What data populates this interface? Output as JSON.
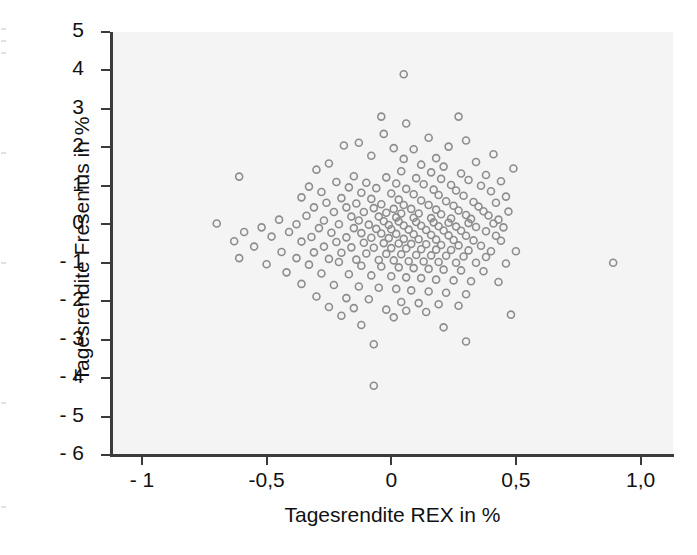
{
  "chart_data": {
    "type": "scatter",
    "title": "",
    "xlabel": "Tagesrendite REX in %",
    "ylabel": "Tagesrendite Fresenius in %",
    "xlim": [
      -1.12,
      1.13
    ],
    "ylim": [
      -6,
      5
    ],
    "grid": false,
    "legend": null,
    "xticks": [
      -1,
      -0.5,
      0,
      0.5,
      1
    ],
    "xticklabels": [
      "- 1",
      "-0,5",
      "0",
      "0,5",
      "1,0"
    ],
    "yticks": [
      5,
      4,
      3,
      2,
      1,
      0,
      -1,
      -2,
      -3,
      -4,
      -5,
      -6
    ],
    "yticklabels": [
      "5",
      "4",
      "3",
      "2",
      "1",
      "0",
      "- 1",
      "- 2",
      "- 3",
      "- 4",
      "- 5",
      "- 6"
    ],
    "marker": {
      "shape": "circle-open",
      "diameter_px": 7,
      "stroke_color": "#8d8d8d",
      "stroke_width": 1.6,
      "fill": "none"
    },
    "panel_facecolor": "#f4f4f4",
    "axis_color": "#3b3b3b",
    "n_points": 232,
    "points": [
      [
        0.05,
        3.9
      ],
      [
        -0.04,
        2.8
      ],
      [
        0.27,
        2.8
      ],
      [
        0.06,
        2.62
      ],
      [
        -0.03,
        2.35
      ],
      [
        0.15,
        2.25
      ],
      [
        0.3,
        2.18
      ],
      [
        -0.13,
        2.12
      ],
      [
        -0.19,
        2.05
      ],
      [
        0.23,
        2.02
      ],
      [
        0.01,
        1.98
      ],
      [
        0.09,
        1.95
      ],
      [
        0.41,
        1.82
      ],
      [
        -0.08,
        1.78
      ],
      [
        0.18,
        1.72
      ],
      [
        0.05,
        1.7
      ],
      [
        0.34,
        1.62
      ],
      [
        -0.25,
        1.58
      ],
      [
        0.12,
        1.55
      ],
      [
        0.21,
        1.5
      ],
      [
        0.49,
        1.45
      ],
      [
        -0.3,
        1.42
      ],
      [
        -0.61,
        1.24
      ],
      [
        0.04,
        1.38
      ],
      [
        0.16,
        1.35
      ],
      [
        0.28,
        1.32
      ],
      [
        0.38,
        1.28
      ],
      [
        -0.15,
        1.25
      ],
      [
        -0.02,
        1.22
      ],
      [
        0.1,
        1.2
      ],
      [
        0.2,
        1.18
      ],
      [
        0.31,
        1.15
      ],
      [
        0.44,
        1.12
      ],
      [
        -0.22,
        1.1
      ],
      [
        -0.1,
        1.08
      ],
      [
        0.02,
        1.06
      ],
      [
        0.13,
        1.04
      ],
      [
        0.24,
        1.02
      ],
      [
        0.36,
        1.0
      ],
      [
        -0.33,
        0.98
      ],
      [
        -0.17,
        0.96
      ],
      [
        -0.06,
        0.94
      ],
      [
        0.06,
        0.92
      ],
      [
        0.17,
        0.9
      ],
      [
        0.26,
        0.88
      ],
      [
        0.4,
        0.86
      ],
      [
        -0.28,
        0.84
      ],
      [
        -0.12,
        0.82
      ],
      [
        0.0,
        0.8
      ],
      [
        0.09,
        0.78
      ],
      [
        0.19,
        0.76
      ],
      [
        0.29,
        0.74
      ],
      [
        0.46,
        0.72
      ],
      [
        -0.36,
        0.7
      ],
      [
        -0.2,
        0.68
      ],
      [
        -0.08,
        0.66
      ],
      [
        0.03,
        0.64
      ],
      [
        0.12,
        0.62
      ],
      [
        0.22,
        0.6
      ],
      [
        0.33,
        0.58
      ],
      [
        0.42,
        0.56
      ],
      [
        -0.26,
        0.56
      ],
      [
        -0.14,
        0.54
      ],
      [
        -0.04,
        0.52
      ],
      [
        0.05,
        0.5
      ],
      [
        0.15,
        0.5
      ],
      [
        0.25,
        0.48
      ],
      [
        0.35,
        0.46
      ],
      [
        -0.31,
        0.44
      ],
      [
        -0.18,
        0.44
      ],
      [
        -0.07,
        0.42
      ],
      [
        0.01,
        0.4
      ],
      [
        0.08,
        0.4
      ],
      [
        0.18,
        0.38
      ],
      [
        0.27,
        0.36
      ],
      [
        0.37,
        0.34
      ],
      [
        0.47,
        0.33
      ],
      [
        -0.23,
        0.32
      ],
      [
        -0.11,
        0.32
      ],
      [
        -0.02,
        0.3
      ],
      [
        0.04,
        0.28
      ],
      [
        0.11,
        0.28
      ],
      [
        0.2,
        0.26
      ],
      [
        0.3,
        0.24
      ],
      [
        0.39,
        0.23
      ],
      [
        -0.34,
        0.22
      ],
      [
        -0.16,
        0.2
      ],
      [
        -0.05,
        0.2
      ],
      [
        0.02,
        0.18
      ],
      [
        0.09,
        0.17
      ],
      [
        0.16,
        0.16
      ],
      [
        0.24,
        0.15
      ],
      [
        0.32,
        0.14
      ],
      [
        0.43,
        0.12
      ],
      [
        -0.45,
        0.12
      ],
      [
        -0.27,
        0.1
      ],
      [
        -0.13,
        0.1
      ],
      [
        -0.03,
        0.08
      ],
      [
        0.03,
        0.07
      ],
      [
        0.1,
        0.06
      ],
      [
        0.17,
        0.05
      ],
      [
        0.23,
        0.04
      ],
      [
        0.31,
        0.03
      ],
      [
        0.41,
        0.02
      ],
      [
        -0.7,
        0.02
      ],
      [
        -0.38,
        0.0
      ],
      [
        -0.21,
        0.0
      ],
      [
        -0.09,
        -0.01
      ],
      [
        -0.01,
        -0.02
      ],
      [
        0.05,
        -0.03
      ],
      [
        0.12,
        -0.04
      ],
      [
        0.19,
        -0.05
      ],
      [
        0.26,
        -0.06
      ],
      [
        0.34,
        -0.07
      ],
      [
        0.45,
        -0.08
      ],
      [
        -0.52,
        -0.08
      ],
      [
        -0.29,
        -0.1
      ],
      [
        -0.15,
        -0.1
      ],
      [
        -0.06,
        -0.12
      ],
      [
        0.0,
        -0.13
      ],
      [
        0.07,
        -0.14
      ],
      [
        0.14,
        -0.15
      ],
      [
        0.21,
        -0.16
      ],
      [
        0.28,
        -0.17
      ],
      [
        0.38,
        -0.18
      ],
      [
        -0.59,
        -0.2
      ],
      [
        -0.41,
        -0.2
      ],
      [
        -0.24,
        -0.22
      ],
      [
        -0.12,
        -0.23
      ],
      [
        -0.04,
        -0.24
      ],
      [
        0.02,
        -0.25
      ],
      [
        0.09,
        -0.26
      ],
      [
        0.16,
        -0.28
      ],
      [
        0.23,
        -0.29
      ],
      [
        0.3,
        -0.3
      ],
      [
        0.42,
        -0.3
      ],
      [
        -0.48,
        -0.32
      ],
      [
        -0.32,
        -0.33
      ],
      [
        -0.18,
        -0.34
      ],
      [
        -0.08,
        -0.35
      ],
      [
        -0.01,
        -0.36
      ],
      [
        0.05,
        -0.38
      ],
      [
        0.11,
        -0.39
      ],
      [
        0.18,
        -0.4
      ],
      [
        0.25,
        -0.41
      ],
      [
        0.33,
        -0.42
      ],
      [
        0.44,
        -0.43
      ],
      [
        -0.63,
        -0.44
      ],
      [
        -0.36,
        -0.45
      ],
      [
        -0.22,
        -0.46
      ],
      [
        -0.11,
        -0.48
      ],
      [
        -0.03,
        -0.49
      ],
      [
        0.03,
        -0.5
      ],
      [
        0.08,
        -0.51
      ],
      [
        0.14,
        -0.52
      ],
      [
        0.2,
        -0.54
      ],
      [
        0.27,
        -0.55
      ],
      [
        0.36,
        -0.56
      ],
      [
        -0.55,
        -0.58
      ],
      [
        -0.27,
        -0.58
      ],
      [
        -0.16,
        -0.6
      ],
      [
        -0.07,
        -0.61
      ],
      [
        0.0,
        -0.62
      ],
      [
        0.06,
        -0.63
      ],
      [
        0.12,
        -0.65
      ],
      [
        0.18,
        -0.66
      ],
      [
        0.24,
        -0.67
      ],
      [
        0.31,
        -0.68
      ],
      [
        0.4,
        -0.7
      ],
      [
        0.5,
        -0.7
      ],
      [
        -0.44,
        -0.72
      ],
      [
        -0.31,
        -0.73
      ],
      [
        -0.2,
        -0.74
      ],
      [
        -0.1,
        -0.76
      ],
      [
        -0.02,
        -0.77
      ],
      [
        0.04,
        -0.78
      ],
      [
        0.1,
        -0.8
      ],
      [
        0.16,
        -0.81
      ],
      [
        0.22,
        -0.82
      ],
      [
        0.29,
        -0.84
      ],
      [
        0.38,
        -0.85
      ],
      [
        -0.61,
        -0.88
      ],
      [
        -0.38,
        -0.88
      ],
      [
        -0.25,
        -0.9
      ],
      [
        -0.14,
        -0.92
      ],
      [
        -0.05,
        -0.93
      ],
      [
        0.01,
        -0.94
      ],
      [
        0.07,
        -0.96
      ],
      [
        0.13,
        -0.97
      ],
      [
        0.19,
        -0.98
      ],
      [
        0.26,
        -1.0
      ],
      [
        0.34,
        -1.0
      ],
      [
        0.46,
        -1.02
      ],
      [
        0.89,
        -1.0
      ],
      [
        -0.5,
        -1.04
      ],
      [
        -0.33,
        -1.05
      ],
      [
        -0.21,
        -0.98
      ],
      [
        -0.12,
        -1.08
      ],
      [
        -0.04,
        -1.1
      ],
      [
        0.03,
        -1.12
      ],
      [
        0.09,
        -1.14
      ],
      [
        0.15,
        -1.16
      ],
      [
        0.21,
        -1.18
      ],
      [
        0.28,
        -1.2
      ],
      [
        0.37,
        -1.22
      ],
      [
        -0.42,
        -1.25
      ],
      [
        -0.28,
        -1.28
      ],
      [
        -0.17,
        -1.3
      ],
      [
        -0.08,
        -1.33
      ],
      [
        0.0,
        -1.35
      ],
      [
        0.06,
        -1.38
      ],
      [
        0.12,
        -1.4
      ],
      [
        0.18,
        -1.44
      ],
      [
        0.25,
        -1.46
      ],
      [
        0.32,
        -1.48
      ],
      [
        0.43,
        -1.5
      ],
      [
        -0.36,
        -1.55
      ],
      [
        -0.23,
        -1.58
      ],
      [
        -0.13,
        -1.62
      ],
      [
        -0.05,
        -1.65
      ],
      [
        0.02,
        -1.68
      ],
      [
        0.08,
        -1.72
      ],
      [
        0.15,
        -1.75
      ],
      [
        0.22,
        -1.78
      ],
      [
        0.3,
        -1.82
      ],
      [
        -0.3,
        -1.88
      ],
      [
        -0.18,
        -1.92
      ],
      [
        -0.09,
        -1.95
      ],
      [
        0.04,
        -2.02
      ],
      [
        0.11,
        -2.05
      ],
      [
        0.19,
        -2.08
      ],
      [
        0.27,
        -2.12
      ],
      [
        -0.25,
        -2.15
      ],
      [
        -0.15,
        -2.18
      ],
      [
        -0.02,
        -2.22
      ],
      [
        0.06,
        -2.25
      ],
      [
        0.14,
        -2.28
      ],
      [
        0.48,
        -2.35
      ],
      [
        -0.2,
        -2.38
      ],
      [
        0.01,
        -2.42
      ],
      [
        -0.12,
        -2.62
      ],
      [
        0.21,
        -2.68
      ],
      [
        0.3,
        -3.05
      ],
      [
        -0.07,
        -3.12
      ],
      [
        -0.07,
        -4.2
      ]
    ]
  },
  "axis_labels": {
    "x_title": "Tagesrendite REX in %",
    "y_title": "Tagesrendite Fresenius in %"
  }
}
